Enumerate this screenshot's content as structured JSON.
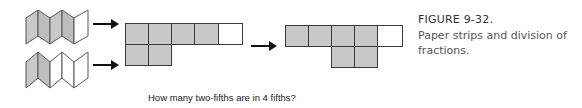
{
  "figure": {
    "title": "FIGURE 9-32.",
    "description": "Paper strips and division of fractions."
  },
  "caption": "How many two-fifths are in 4 fifths?",
  "strips": [
    {
      "name": "folded-strip-four-fifths",
      "panels": 5,
      "shaded": 4
    },
    {
      "name": "folded-strip-two-fifths",
      "panels": 5,
      "shaded": 2
    }
  ],
  "left_grid": {
    "rows": [
      {
        "offset": 0,
        "cells": [
          "shaded",
          "shaded",
          "shaded",
          "shaded",
          "empty"
        ]
      },
      {
        "offset": 0,
        "cells": [
          "shaded",
          "shaded"
        ]
      }
    ]
  },
  "right_grid": {
    "rows": [
      {
        "offset": 0,
        "cells": [
          "shaded",
          "shaded",
          "shaded",
          "shaded",
          "empty"
        ]
      },
      {
        "offset": 2,
        "cells": [
          "shaded",
          "shaded"
        ]
      }
    ]
  },
  "colors": {
    "shade": "#c8c8c8",
    "line": "#3a3a3a",
    "text": "#444444"
  }
}
